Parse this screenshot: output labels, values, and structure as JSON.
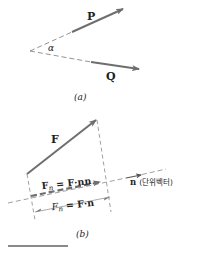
{
  "colors": {
    "vector": "#6e6e6e",
    "dash": "#777777",
    "text": "#222222",
    "rule": "#8a8a8a"
  },
  "figure_a": {
    "caption": "(a)",
    "vector_p_label": "P",
    "vector_q_label": "Q",
    "angle_label": "α"
  },
  "figure_b": {
    "caption": "(b)",
    "vector_f_label": "F",
    "projection_vector_label": "F",
    "projection_vector_sub": "n",
    "projection_vector_eq": " = F·nn",
    "projection_scalar_label": "F",
    "projection_scalar_sub": "n",
    "projection_scalar_eq": " = F·n",
    "unit_vector_label": "n",
    "unit_vector_note": "(단위벡터)"
  }
}
